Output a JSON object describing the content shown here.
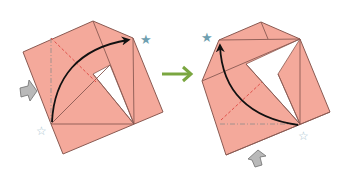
{
  "diagram": {
    "type": "origami-instruction",
    "steps": [
      {
        "id": "step-before",
        "paper_color": "#f4a99b",
        "edge_color": "#8a5a52",
        "markers": {
          "filled_star": "top-right corner",
          "hollow_star": "bottom-left corner",
          "push_arrow": "left side"
        },
        "fold_lines": [
          "valley-diagonal-red-dashed",
          "mountain-vertical-gray-dashdot"
        ],
        "motion_arrow": "curved, from bottom-left up to top-right star"
      },
      {
        "id": "step-after",
        "paper_color": "#f4a99b",
        "edge_color": "#8a5a52",
        "markers": {
          "filled_star": "top-left corner",
          "hollow_star": "bottom-right corner",
          "push_arrow": "bottom side"
        },
        "fold_lines": [
          "valley-diagonal-red-dashed",
          "mountain-horizontal-gray-dashdot"
        ],
        "motion_arrow": "curved, from bottom-right up to top-left star"
      }
    ],
    "transition_arrow": "right",
    "colors": {
      "paper": "#f4a99b",
      "edge": "#8a5a52",
      "valley_line": "#e0504a",
      "mountain_line": "#9a8e8c",
      "motion_arrow": "#111111",
      "push_arrow_fill": "#b9b9b9",
      "push_arrow_stroke": "#6e6e6e",
      "filled_star": "#6f9fb0",
      "hollow_star": "#a9c3cf",
      "transition_arrow": "#7aa640"
    }
  }
}
